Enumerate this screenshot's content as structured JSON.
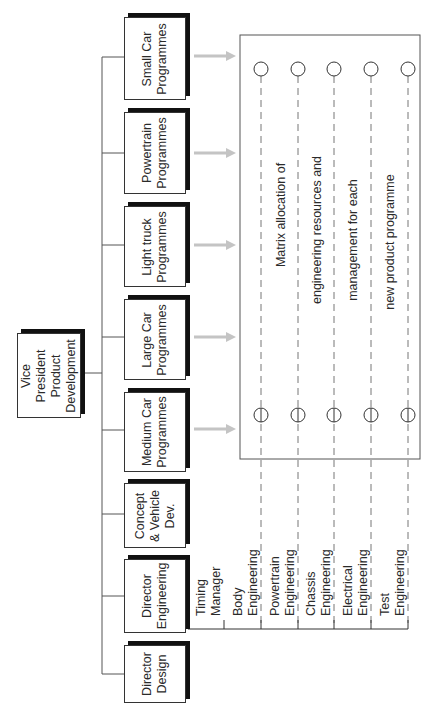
{
  "diagram": {
    "type": "organization-chart-rotated",
    "root": {
      "label_lines": [
        "Vice",
        "President",
        "Product",
        "Development"
      ]
    },
    "units": [
      {
        "id": "small-car",
        "label_lines": [
          "Small Car",
          "Programmes"
        ]
      },
      {
        "id": "powertrain",
        "label_lines": [
          "Powertrain",
          "Programmes"
        ]
      },
      {
        "id": "light-truck",
        "label_lines": [
          "Light truck",
          "Programmes"
        ]
      },
      {
        "id": "large-car",
        "label_lines": [
          "Large Car",
          "Programmes"
        ]
      },
      {
        "id": "medium-car",
        "label_lines": [
          "Medium Car",
          "Programmes"
        ]
      },
      {
        "id": "concept",
        "label_lines": [
          "Concept",
          "& Vehicle",
          "Dev."
        ]
      },
      {
        "id": "director-engineering",
        "label_lines": [
          "Director",
          "Engineering"
        ]
      },
      {
        "id": "director-design",
        "label_lines": [
          "Director",
          "Design"
        ]
      }
    ],
    "engineering_functions": [
      {
        "label_lines": [
          "Timing",
          "Manager"
        ]
      },
      {
        "label_lines": [
          "Body",
          "Engineering"
        ]
      },
      {
        "label_lines": [
          "Powertrain",
          "Engineering"
        ]
      },
      {
        "label_lines": [
          "Chassis",
          "Engineering"
        ]
      },
      {
        "label_lines": [
          "Electrical",
          "Engineering"
        ]
      },
      {
        "label_lines": [
          "Test",
          "Engineering"
        ]
      }
    ],
    "matrix": {
      "text_lines": [
        "Matrix allocation of",
        "engineering resources and",
        "management for each",
        "new product programme"
      ]
    },
    "colors": {
      "line": "#555555",
      "box_border": "#333333",
      "shadow": "#111111",
      "arrow": "#c4c4c4",
      "dash": "#777777"
    }
  }
}
